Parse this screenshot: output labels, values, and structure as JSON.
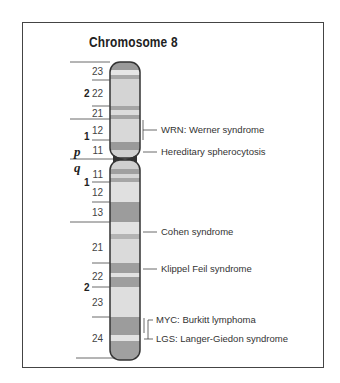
{
  "title": "Chromosome 8",
  "arms": {
    "p": "p",
    "q": "q"
  },
  "regions": {
    "p2": "2",
    "p1": "1",
    "q1": "1",
    "q2": "2"
  },
  "bands": {
    "p23": "23",
    "p22": "22",
    "p21": "21",
    "p12": "12",
    "p11": "11",
    "q11": "11",
    "q12": "12",
    "q13": "13",
    "q21": "21",
    "q22": "22",
    "q23": "23",
    "q24": "24"
  },
  "annotations": [
    {
      "label": "WRN: Werner syndrome",
      "band": "p12"
    },
    {
      "label": "Hereditary spherocytosis",
      "band": "p11"
    },
    {
      "label": "Cohen syndrome",
      "band": "q22"
    },
    {
      "label": "Klippel Feil syndrome",
      "band": "q22"
    },
    {
      "label": "MYC: Burkitt lymphoma",
      "band": "q24"
    },
    {
      "label": "LGS: Langer-Giedon syndrome",
      "band": "q24"
    }
  ],
  "colors": {
    "light_band": "#d8d8d8",
    "pale_band": "#e8e8e8",
    "dark_band": "#9a9a9a",
    "mid_band": "#b0b0b0",
    "outline": "#333333",
    "frame": "#444444"
  }
}
